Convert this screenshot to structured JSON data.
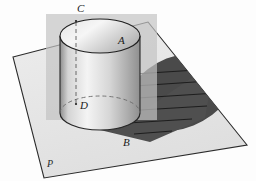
{
  "figure": {
    "type": "solid-geometry-diagram",
    "background_color": "#fdfdfd"
  },
  "labels": [
    {
      "id": "label-A",
      "text": "A",
      "x": 118,
      "y": 44,
      "describes": "point on top circle of cylinder, front right"
    },
    {
      "id": "label-B",
      "text": "B",
      "x": 123,
      "y": 146,
      "describes": "point on base circle of cylinder, front right"
    },
    {
      "id": "label-C",
      "text": "C",
      "x": 77,
      "y": 12,
      "describes": "point on top circle of cylinder, back"
    },
    {
      "id": "label-D",
      "text": "D",
      "x": 80,
      "y": 109,
      "describes": "point on base circle of cylinder, back"
    },
    {
      "id": "label-P",
      "text": "P",
      "x": 47,
      "y": 167,
      "describes": "the horizontal plane"
    }
  ],
  "plane": {
    "name": "P",
    "fill": "#e9e9e9",
    "stroke": "#2b2b2b",
    "corners": [
      {
        "x": 13,
        "y": 57
      },
      {
        "x": 148,
        "y": 22
      },
      {
        "x": 247,
        "y": 145
      },
      {
        "x": 44,
        "y": 178
      }
    ]
  },
  "cylinder": {
    "center_x": 100,
    "top_center_y": 36,
    "bottom_center_y": 113,
    "radius_x": 40,
    "radius_y": 17,
    "top_fill_light": "#f2f2f2",
    "top_fill_dark": "#b9b9b9",
    "body_fill_light": "#efefef",
    "body_fill_dark": "#a8a8a8",
    "stroke": "#262626",
    "hidden_edge_style": "dashed"
  },
  "cutting_plane": {
    "fill": "#c3c3c3",
    "opacity": 0.72,
    "corners": [
      {
        "x": 46,
        "y": 14
      },
      {
        "x": 157,
        "y": 14
      },
      {
        "x": 157,
        "y": 120
      },
      {
        "x": 46,
        "y": 120
      }
    ]
  },
  "shadow": {
    "fill": "#4a4a4a",
    "center_x": 180,
    "center_y": 92,
    "radius_x": 56,
    "radius_y": 36,
    "rotation_deg": -22,
    "ray_count": 6,
    "ray_color": "#171717"
  },
  "axis_line": {
    "color": "#5a5a5a",
    "style": "dashed",
    "from": {
      "x": 76,
      "y": 22
    },
    "to": {
      "x": 76,
      "y": 104
    }
  }
}
